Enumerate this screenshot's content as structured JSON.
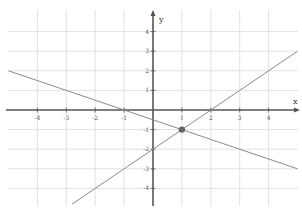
{
  "chart_data": {
    "type": "line",
    "title": "",
    "xlabel": "x",
    "ylabel": "y",
    "xlim": [
      -5,
      5
    ],
    "ylim": [
      -5,
      5
    ],
    "grid": true,
    "x_ticks": [
      -4,
      -3,
      -2,
      -1,
      1,
      2,
      3,
      4
    ],
    "y_ticks": [
      4,
      3,
      2,
      1,
      -1,
      -2,
      -3,
      -4
    ],
    "x_tick_labels": [
      "-4",
      "-3",
      "-2",
      "-1",
      "1",
      "2",
      "3",
      "4"
    ],
    "y_tick_labels": [
      "4",
      "3",
      "2",
      "1",
      "-1",
      "-2",
      "-3",
      "-4"
    ],
    "series": [
      {
        "name": "line-decreasing",
        "equation": "y = -0.5x - 0.5",
        "x": [
          -5,
          5
        ],
        "y": [
          2,
          -3
        ]
      },
      {
        "name": "line-increasing",
        "equation": "y = x - 2",
        "x": [
          -2.8,
          5
        ],
        "y": [
          -4.8,
          3
        ]
      }
    ],
    "annotations": [
      {
        "type": "point",
        "x": 1,
        "y": -1,
        "label": "intersection"
      }
    ]
  },
  "axes": {
    "x_label": "x",
    "y_label": "y"
  },
  "colors": {
    "grid": "#e2e2e2",
    "axis": "#555555",
    "line": "#8a8a8a",
    "point": "#666666"
  }
}
